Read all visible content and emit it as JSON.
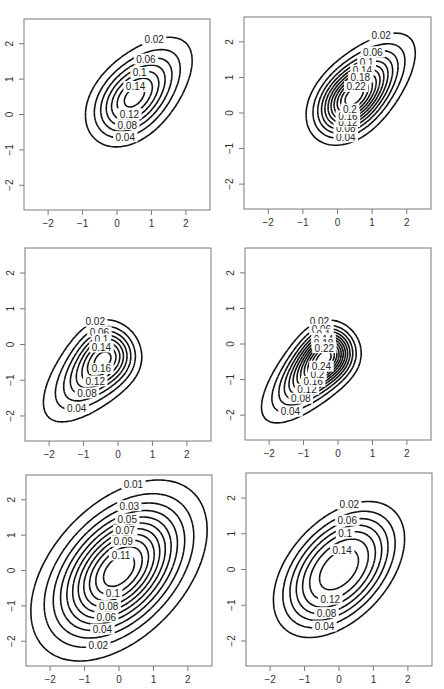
{
  "figure": {
    "layout": "3 rows x 2 columns of bivariate density contour plots"
  },
  "chart_data": [
    {
      "type": "contour",
      "panel": "row1-left",
      "xlim": [
        -2.7,
        2.7
      ],
      "ylim": [
        -2.7,
        2.7
      ],
      "xticks": [
        "-2",
        "-1",
        "0",
        "1",
        "2"
      ],
      "yticks": [
        "-2",
        "-1",
        "0",
        "1",
        "2"
      ],
      "levels": [
        0.02,
        0.04,
        0.06,
        0.08,
        0.1,
        0.12,
        0.14
      ],
      "visible_labels": [
        "0.06",
        "0.1",
        "0.12",
        "0.14",
        "0.08",
        "0.04",
        "0.02"
      ],
      "shape": "skewed ellipse, positive correlation, tail toward lower-left",
      "model": {
        "rho": 0.7,
        "sx": 1.0,
        "sy": 1.0,
        "skew": [
          1.6,
          1.6
        ],
        "mx": 0.0,
        "my": 0.0
      }
    },
    {
      "type": "contour",
      "panel": "row1-right",
      "xlim": [
        -2.7,
        2.7
      ],
      "ylim": [
        -2.7,
        2.7
      ],
      "xticks": [
        "-2",
        "-1",
        "0",
        "1",
        "2"
      ],
      "yticks": [
        "-2",
        "-1",
        "0",
        "1",
        "2"
      ],
      "levels": [
        0.02,
        0.04,
        0.06,
        0.08,
        0.1,
        0.12,
        0.14,
        0.16,
        0.18,
        0.2,
        0.22
      ],
      "visible_labels": [
        "0.06",
        "0.1",
        "0.12",
        "0.16",
        "0.14",
        "0.08",
        "0.04",
        "0.02"
      ],
      "shape": "skewed ellipse, stronger peak, positive correlation",
      "model": {
        "rho": 0.75,
        "sx": 0.95,
        "sy": 0.95,
        "skew": [
          1.8,
          1.8
        ],
        "mx": 0.0,
        "my": 0.0
      }
    },
    {
      "type": "contour",
      "panel": "row2-left",
      "xlim": [
        -2.7,
        2.7
      ],
      "ylim": [
        -2.7,
        2.7
      ],
      "xticks": [
        "-2",
        "-1",
        "0",
        "1",
        "2"
      ],
      "yticks": [
        "-2",
        "-1",
        "0",
        "1",
        "2"
      ],
      "levels": [
        0.02,
        0.04,
        0.06,
        0.08,
        0.1,
        0.12,
        0.14,
        0.16
      ],
      "visible_labels": [
        "0.02",
        "0.04",
        "0.08",
        "0.12",
        "0.16",
        "0.14",
        "0.1",
        "0.06"
      ],
      "shape": "teardrop, wide upper-right, narrow tail to lower-left",
      "model": {
        "rho": 0.75,
        "sx": 1.0,
        "sy": 1.0,
        "skew": [
          -3.0,
          -3.0
        ],
        "mx": 0.0,
        "my": 0.0
      }
    },
    {
      "type": "contour",
      "panel": "row2-right",
      "xlim": [
        -2.7,
        2.7
      ],
      "ylim": [
        -2.7,
        2.7
      ],
      "xticks": [
        "-2",
        "-1",
        "0",
        "1",
        "2"
      ],
      "yticks": [
        "-2",
        "-1",
        "0",
        "1",
        "2"
      ],
      "levels": [
        0.02,
        0.04,
        0.06,
        0.08,
        0.1,
        0.12,
        0.14,
        0.16,
        0.18,
        0.2,
        0.22,
        0.24
      ],
      "visible_labels": [
        "0.02",
        "0.04",
        "0.08",
        "0.12",
        "0.16",
        "0.18",
        "0.14",
        "0.1",
        "0.06"
      ],
      "shape": "teardrop with sharp peak (dots at mode)",
      "model": {
        "rho": 0.8,
        "sx": 0.95,
        "sy": 0.95,
        "skew": [
          -3.2,
          -3.2
        ],
        "mx": 0.0,
        "my": 0.0
      }
    },
    {
      "type": "contour",
      "panel": "row3-left",
      "xlim": [
        -2.7,
        2.7
      ],
      "ylim": [
        -2.7,
        2.7
      ],
      "xticks": [
        "-2",
        "-1",
        "0",
        "1",
        "2"
      ],
      "yticks": [
        "-2",
        "-1",
        "0",
        "1",
        "2"
      ],
      "levels": [
        0.01,
        0.02,
        0.03,
        0.04,
        0.05,
        0.06,
        0.07,
        0.08,
        0.09,
        0.1,
        0.11
      ],
      "visible_labels": [
        "0.01",
        "0.02",
        "0.01",
        "0.04",
        "0.07",
        "0.09",
        "0.11",
        "0.1",
        "0.08",
        "0.06",
        "0.05",
        "0.03",
        "0.01",
        "0.01"
      ],
      "shape": "near-elliptical, positive correlation, heavy tails",
      "model": {
        "rho": 0.45,
        "sx": 1.15,
        "sy": 1.15,
        "skew": [
          0.0,
          0.0
        ],
        "mx": 0.0,
        "my": 0.0
      }
    },
    {
      "type": "contour",
      "panel": "row3-right",
      "xlim": [
        -2.7,
        2.7
      ],
      "ylim": [
        -2.7,
        2.7
      ],
      "xticks": [
        "-2",
        "-1",
        "0",
        "1",
        "2"
      ],
      "yticks": [
        "-2",
        "-1",
        "0",
        "1",
        "2"
      ],
      "levels": [
        0.02,
        0.04,
        0.06,
        0.08,
        0.1,
        0.12,
        0.14
      ],
      "visible_labels": [
        "0.04",
        "0.08",
        "0.12",
        "0.14",
        "0.1",
        "0.06",
        "0.02"
      ],
      "shape": "rounded-rectangle ellipse, positive correlation, light tails",
      "model": {
        "rho": 0.45,
        "sx": 0.95,
        "sy": 0.95,
        "skew": [
          0.0,
          0.0
        ],
        "mx": 0.0,
        "my": 0.0,
        "flat": true
      }
    }
  ],
  "panels_px": [
    {
      "x": 24,
      "y": 19,
      "w": 186,
      "h": 191
    },
    {
      "x": 244,
      "y": 17,
      "w": 187,
      "h": 192
    },
    {
      "x": 25,
      "y": 248,
      "w": 186,
      "h": 193
    },
    {
      "x": 245,
      "y": 248,
      "w": 186,
      "h": 192
    },
    {
      "x": 26,
      "y": 475,
      "w": 186,
      "h": 191
    },
    {
      "x": 246,
      "y": 473,
      "w": 186,
      "h": 193
    }
  ]
}
